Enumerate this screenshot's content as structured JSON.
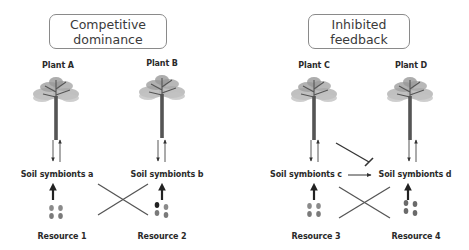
{
  "panels": [
    {
      "title_line1": "Competitive",
      "title_line2": "dominance",
      "plants": [
        "Plant A",
        "Plant B"
      ],
      "symbionts": [
        "Soil symbionts a",
        "Soil symbionts b"
      ],
      "resources": [
        "Resource 1",
        "Resource 2"
      ]
    },
    {
      "title_line1": "Inhibited",
      "title_line2": "feedback",
      "plants": [
        "Plant C",
        "Plant D"
      ],
      "symbionts": [
        "Soil symbionts c",
        "Soil symbionts d"
      ],
      "resources": [
        "Resource 3",
        "Resource 4"
      ]
    }
  ],
  "colors": {
    "foliage": "#a8a8a8",
    "trunk": "#555555",
    "arrow": "#333333",
    "box_border": "#8a8a8a",
    "dot": "#7a7a7a"
  }
}
